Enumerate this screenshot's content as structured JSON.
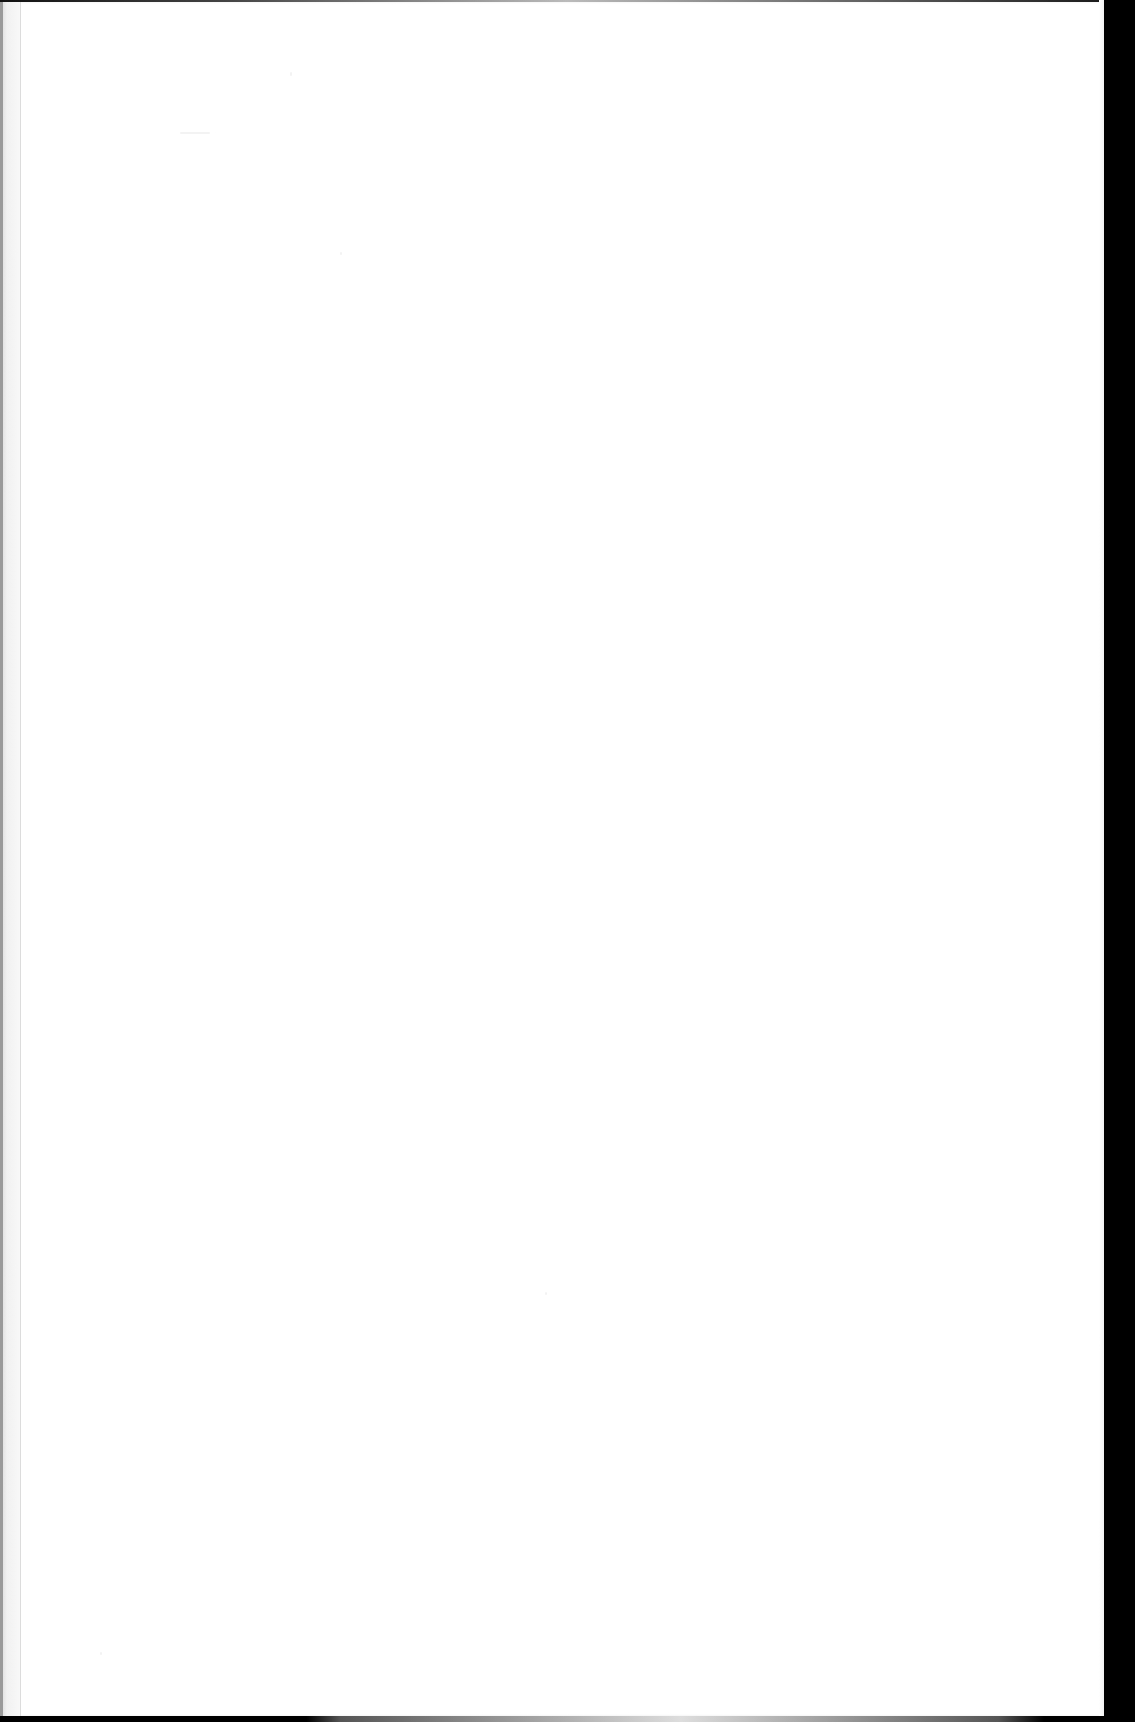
{
  "document": {
    "type": "scanned-page",
    "state": "blank",
    "text_content": "",
    "has_legible_text": false
  },
  "page": {
    "paper_color": "#ffffff",
    "background_color": "#000000",
    "gutter_color": "#e6e6e6"
  }
}
